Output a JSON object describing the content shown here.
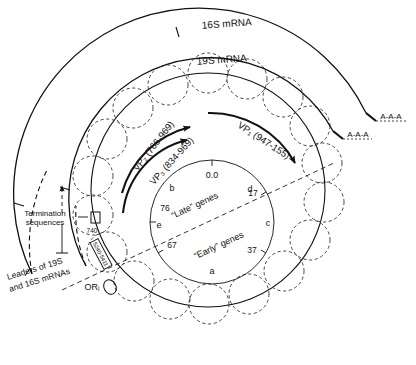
{
  "figure": {
    "type": "circular-genome-diagram"
  },
  "transcripts": {
    "outer_label": "16S mRNA",
    "inner_label": "19S mRNA",
    "polya_outer": "A-A-A",
    "polya_inner": "A-A-A"
  },
  "proteins": [
    {
      "label": "VP₂ (766-969)"
    },
    {
      "label": "VP₃ (834-969)"
    },
    {
      "label": "VP₁ (947-155)"
    }
  ],
  "annotations": {
    "termination": "Termination\nsequences",
    "termination_line1": "Termination",
    "termination_line2": "sequences",
    "termination_coord": "740",
    "leaders_line1": "Leaders of 19S",
    "leaders_line2": "and 16S mRNAs",
    "origin": "ORᵢ",
    "origin_box": "5240-5411"
  },
  "genome_map": {
    "zero": "0.0",
    "late_genes": "“Late” genes",
    "early_genes": "“Early” genes",
    "ticks": [
      {
        "value": "0.0"
      },
      {
        "value": "17"
      },
      {
        "value": "37"
      },
      {
        "value": "67"
      },
      {
        "value": "76"
      }
    ],
    "fragments": [
      {
        "letter": "a"
      },
      {
        "letter": "b"
      },
      {
        "letter": "c"
      },
      {
        "letter": "d"
      },
      {
        "letter": "e"
      }
    ]
  },
  "colors": {
    "ink": "#111111",
    "paper": "#ffffff",
    "nucleosome": "#333333"
  }
}
